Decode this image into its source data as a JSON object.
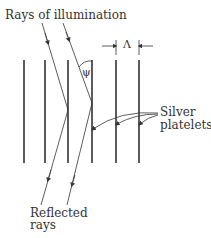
{
  "labels": {
    "illumination": "Rays of illumination",
    "silver_line1": "Silver",
    "silver_line2": "platelets",
    "reflected_line1": "Reflected",
    "reflected_line2": "rays",
    "spacing_symbol": "Λ",
    "angle_symbol": "ψ"
  },
  "colors": {
    "stroke": "#333333",
    "background": "#ffffff"
  },
  "platelets_x": [
    24,
    45,
    68,
    92,
    116,
    139
  ],
  "platelet_top": 60,
  "platelet_bottom": 163
}
